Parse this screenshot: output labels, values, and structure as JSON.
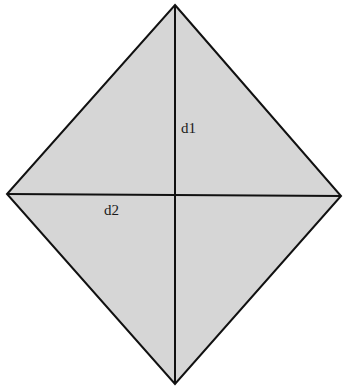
{
  "diagram": {
    "shape": "rhombus",
    "fill_color": "#d6d6d6",
    "stroke_color": "#111111",
    "vertices": {
      "top": [
        175,
        5
      ],
      "right": [
        341,
        196
      ],
      "bottom": [
        175,
        384
      ],
      "left": [
        7,
        194
      ]
    },
    "diagonals": [
      {
        "name": "d1",
        "label": "d1",
        "from": [
          175,
          5
        ],
        "to": [
          175,
          384
        ]
      },
      {
        "name": "d2",
        "label": "d2",
        "from": [
          7,
          194
        ],
        "to": [
          341,
          196
        ]
      }
    ]
  }
}
